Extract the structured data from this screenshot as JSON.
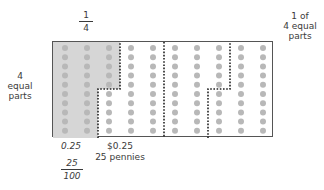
{
  "diagram": {
    "title_fraction": {
      "numerator": "1",
      "denominator": "4"
    },
    "right_label": [
      "1 of",
      "4 equal",
      "parts"
    ],
    "left_label": [
      "4",
      "equal",
      "parts"
    ],
    "bottom": {
      "decimal": "0.25",
      "money": "$0.25",
      "pennies": "25 pennies",
      "fraction": {
        "numerator": "25",
        "denominator": "100"
      }
    },
    "grid": {
      "rows": 10,
      "columns": 10,
      "total_dots": 100,
      "shaded_dots": 25,
      "shaded_color": "#d4d4d4",
      "dot_color": "#b8b8b8",
      "partitions": 4
    }
  }
}
